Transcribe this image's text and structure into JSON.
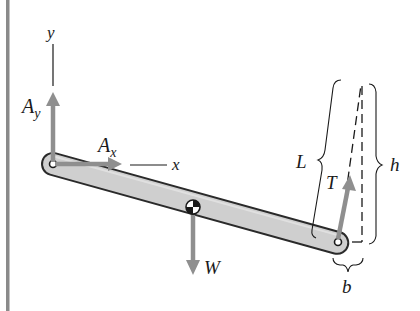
{
  "diagram": {
    "colors": {
      "wall": "#8a8a8a",
      "bar_fill": "#cfcfcf",
      "bar_stroke": "#2a2a2a",
      "force_arrow": "#8f8f8f",
      "text": "#1a1a1a",
      "dashed": "#1a1a1a"
    },
    "axes": {
      "x_label": "x",
      "y_label": "y"
    },
    "forces": {
      "Ay": {
        "main": "A",
        "sub": "y"
      },
      "Ax": {
        "main": "A",
        "sub": "x"
      },
      "W": {
        "main": "W"
      },
      "T": {
        "main": "T"
      }
    },
    "dimensions": {
      "L": "L",
      "h": "h",
      "b": "b"
    }
  }
}
